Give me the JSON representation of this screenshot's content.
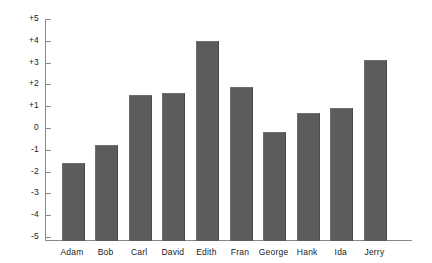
{
  "chart_data": {
    "type": "bar",
    "title": "",
    "subtitle": "",
    "xlabel": "",
    "ylabel": "",
    "categories": [
      "Adam",
      "Bob",
      "Carl",
      "David",
      "Edith",
      "Fran",
      "George",
      "Hank",
      "Ida",
      "Jerry"
    ],
    "values": [
      -1.6,
      -0.8,
      1.5,
      1.6,
      4.0,
      1.9,
      -0.2,
      0.7,
      0.9,
      3.1
    ],
    "ylim": [
      -5,
      5
    ],
    "ytick_values": [
      5,
      4,
      3,
      2,
      1,
      0,
      -1,
      -2,
      -3,
      -4,
      -5
    ],
    "ytick_labels": [
      "+5",
      "+4",
      "+3",
      "+2",
      "+1",
      "0",
      "-1",
      "-2",
      "-3",
      "-4",
      "-5"
    ],
    "grid": false,
    "legend": null,
    "bars_drawn_from": "axis-bottom",
    "colors": {
      "bar_fill": "#5c5c5c",
      "axis": "#8a8a8a",
      "text": "#1a1a1a",
      "background": "#ffffff"
    }
  },
  "layout": {
    "axis_left_px": 45,
    "axis_right_px": 412,
    "axis_bottom_px": 240,
    "axis_top_px": 19,
    "zero_y_px": 128,
    "unit_px": 21.8,
    "bar_width_px": 21,
    "first_bar_center_px": 72,
    "bar_pitch_px": 33.6
  }
}
